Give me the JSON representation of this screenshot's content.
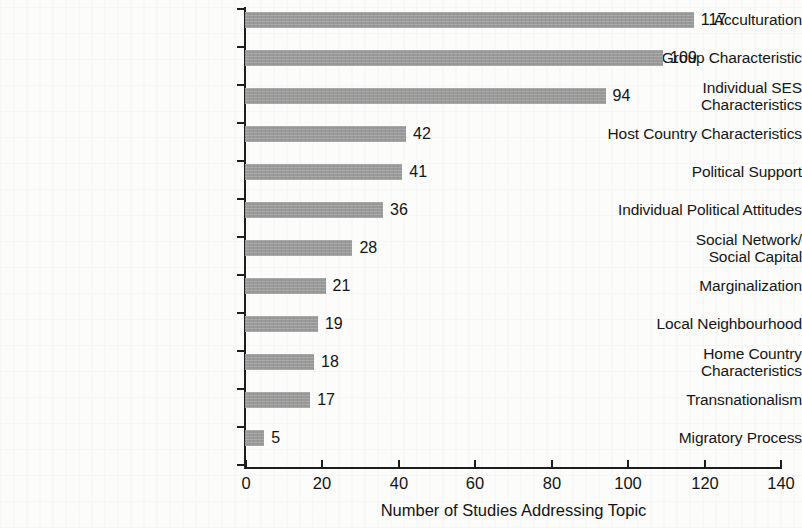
{
  "chart_data": {
    "type": "bar",
    "orientation": "horizontal",
    "title": "",
    "xlabel": "Number of Studies Addressing Topic",
    "ylabel": "",
    "xlim": [
      0,
      140
    ],
    "xticks": [
      0,
      20,
      40,
      60,
      80,
      100,
      120,
      140
    ],
    "grid": false,
    "legend": null,
    "bar_color": "#9a9a9a",
    "axis_color": "#1d1d1d",
    "background_color": "#fcfcfb",
    "categories": [
      "Acculturation",
      "Ethnic Group Characteristic",
      "Individual SES\nCharacteristics",
      "Host Country Characteristics",
      "Political Support",
      "Individual Political Attitudes",
      "Social Network/\nSocial Capital",
      "Marginalization",
      "Local Neighbourhood",
      "Home Country\nCharacteristics",
      "Transnationalism",
      "Migratory Process"
    ],
    "values": [
      117,
      109,
      94,
      42,
      41,
      36,
      28,
      21,
      19,
      18,
      17,
      5
    ],
    "value_labels": [
      "117",
      "109",
      "94",
      "42",
      "41",
      "36",
      "28",
      "21",
      "19",
      "18",
      "17",
      "5"
    ],
    "xtick_labels": [
      "0",
      "20",
      "40",
      "60",
      "80",
      "100",
      "120",
      "140"
    ]
  }
}
